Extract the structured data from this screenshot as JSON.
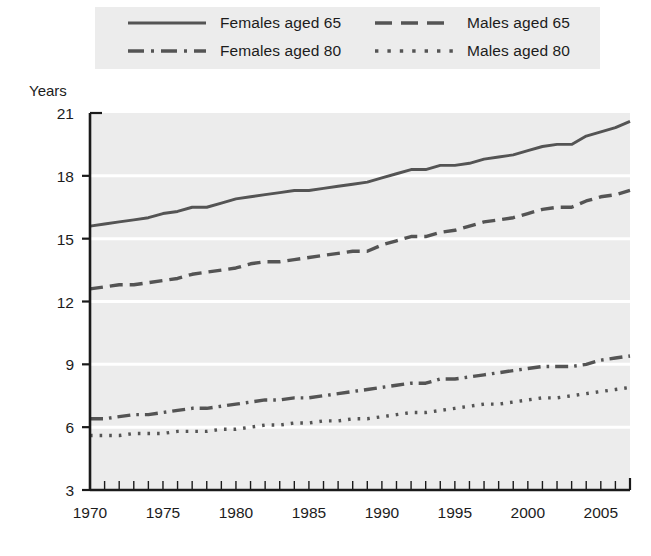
{
  "legend": {
    "items": [
      {
        "label": "Females aged 65",
        "style": "solid",
        "key": "females_65"
      },
      {
        "label": "Males aged 65",
        "style": "dashed",
        "key": "males_65"
      },
      {
        "label": "Females aged 80",
        "style": "dashdot",
        "key": "females_80"
      },
      {
        "label": "Males aged 80",
        "style": "dotted",
        "key": "males_80"
      }
    ]
  },
  "colors": {
    "plot_background": "#ececec",
    "legend_background": "#ececec",
    "gridline": "#ffffff",
    "axis": "#1a1a1a",
    "series": "#545454",
    "page_background": "#ffffff"
  },
  "chart_data": {
    "type": "line",
    "title": "",
    "subtitle": "",
    "xlabel": "",
    "ylabel": "Years",
    "xlim": [
      1970,
      2007
    ],
    "ylim": [
      3,
      21
    ],
    "yticks": [
      3,
      6,
      9,
      12,
      15,
      18,
      21
    ],
    "ytick_labels": [
      "3",
      "6",
      "9",
      "12",
      "15",
      "18",
      "21"
    ],
    "xticks": [
      1970,
      1975,
      1980,
      1985,
      1990,
      1995,
      2000,
      2005
    ],
    "xtick_labels": [
      "1970",
      "1975",
      "1980",
      "1985",
      "1990",
      "1995",
      "2000",
      "2005"
    ],
    "minor_xticks_every": 1,
    "grid": "horizontal",
    "legend_position": "top",
    "x": [
      1970,
      1971,
      1972,
      1973,
      1974,
      1975,
      1976,
      1977,
      1978,
      1979,
      1980,
      1981,
      1982,
      1983,
      1984,
      1985,
      1986,
      1987,
      1988,
      1989,
      1990,
      1991,
      1992,
      1993,
      1994,
      1995,
      1996,
      1997,
      1998,
      1999,
      2000,
      2001,
      2002,
      2003,
      2004,
      2005,
      2006,
      2007
    ],
    "series": [
      {
        "name": "Females aged 65",
        "style": "solid",
        "values": [
          15.6,
          15.7,
          15.8,
          15.9,
          16.0,
          16.2,
          16.3,
          16.5,
          16.5,
          16.7,
          16.9,
          17.0,
          17.1,
          17.2,
          17.3,
          17.3,
          17.4,
          17.5,
          17.6,
          17.7,
          17.9,
          18.1,
          18.3,
          18.3,
          18.5,
          18.5,
          18.6,
          18.8,
          18.9,
          19.0,
          19.2,
          19.4,
          19.5,
          19.5,
          19.9,
          20.1,
          20.3,
          20.6
        ]
      },
      {
        "name": "Males aged 65",
        "style": "dashed",
        "values": [
          12.6,
          12.7,
          12.8,
          12.8,
          12.9,
          13.0,
          13.1,
          13.3,
          13.4,
          13.5,
          13.6,
          13.8,
          13.9,
          13.9,
          14.0,
          14.1,
          14.2,
          14.3,
          14.4,
          14.4,
          14.7,
          14.9,
          15.1,
          15.1,
          15.3,
          15.4,
          15.6,
          15.8,
          15.9,
          16.0,
          16.2,
          16.4,
          16.5,
          16.5,
          16.8,
          17.0,
          17.1,
          17.3
        ]
      },
      {
        "name": "Females aged 80",
        "style": "dashdot",
        "values": [
          6.4,
          6.4,
          6.5,
          6.6,
          6.6,
          6.7,
          6.8,
          6.9,
          6.9,
          7.0,
          7.1,
          7.2,
          7.3,
          7.3,
          7.4,
          7.4,
          7.5,
          7.6,
          7.7,
          7.8,
          7.9,
          8.0,
          8.1,
          8.1,
          8.3,
          8.3,
          8.4,
          8.5,
          8.6,
          8.7,
          8.8,
          8.9,
          8.9,
          8.9,
          9.0,
          9.2,
          9.3,
          9.4
        ]
      },
      {
        "name": "Males aged 80",
        "style": "dotted",
        "values": [
          5.6,
          5.6,
          5.6,
          5.7,
          5.7,
          5.7,
          5.8,
          5.8,
          5.8,
          5.9,
          5.9,
          6.0,
          6.1,
          6.1,
          6.2,
          6.2,
          6.3,
          6.3,
          6.4,
          6.4,
          6.5,
          6.6,
          6.7,
          6.7,
          6.8,
          6.9,
          7.0,
          7.1,
          7.1,
          7.2,
          7.3,
          7.4,
          7.4,
          7.5,
          7.6,
          7.7,
          7.8,
          7.9
        ]
      }
    ]
  }
}
